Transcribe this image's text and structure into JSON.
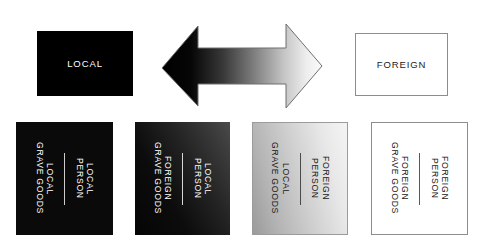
{
  "diagram": {
    "top_row": {
      "left_box": {
        "label": "LOCAL",
        "fill": "#000000",
        "text_color": "#ffffff"
      },
      "arrow": {
        "name": "double-headed-gradient-arrow",
        "gradient_from": "#000000",
        "gradient_to": "#fafafa",
        "direction": "left-right"
      },
      "right_box": {
        "label": "FOREIGN",
        "fill": "#ffffff",
        "text_color": "#1b1b1b",
        "border": "#8d8d8d"
      }
    },
    "bottom_row": [
      {
        "id": "local-person-local-grave-goods",
        "person_label": "LOCAL\nPERSON",
        "goods_label": "LOCAL\nGRAVE GOODS",
        "fill": "#0a0a0a",
        "text_color": "#ffffff"
      },
      {
        "id": "local-person-foreign-grave-goods",
        "person_label": "LOCAL\nPERSON",
        "goods_label": "FOREIGN\nGRAVE GOODS",
        "fill": "#141414",
        "text_color": "#ffffff"
      },
      {
        "id": "foreign-person-local-grave-goods",
        "person_label": "FOREIGN\nPERSON",
        "goods_label": "LOCAL\nGRAVE GOODS",
        "fill": "#cfcfcf",
        "text_color": "#171717"
      },
      {
        "id": "foreign-person-foreign-grave-goods",
        "person_label": "FOREIGN\nPERSON",
        "goods_label": "FOREIGN\nGRAVE GOODS",
        "fill": "#ffffff",
        "text_color": "#171717"
      }
    ]
  }
}
